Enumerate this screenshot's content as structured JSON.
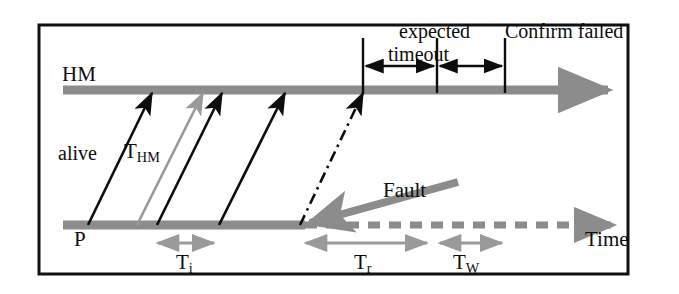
{
  "figure": {
    "kind": "timing-sequence-diagram",
    "colors": {
      "border": "#111111",
      "lifeline_gray": "#8c8c8c",
      "arrow_black": "#0d0d0d",
      "arrow_gray": "#9a9a9a",
      "fault_gray": "#8c8c8c",
      "background": "#ffffff"
    },
    "frame": {
      "x": 38,
      "y": 24,
      "width": 590,
      "height": 250
    }
  },
  "lifelines": {
    "hm": {
      "label": "HM",
      "y": 90,
      "x_start": 63,
      "x_end": 620
    },
    "p": {
      "label": "P",
      "y": 225,
      "x_start": 63,
      "x_solid_end": 303,
      "x_dashed_end": 625
    }
  },
  "labels": {
    "alive": "alive",
    "t_hm": "T",
    "t_hm_sub": "HM",
    "expected": "expected",
    "confirm_failed": "Confirm failed",
    "timeout": "timeout",
    "fault": "Fault",
    "time": "Time"
  },
  "intervals": [
    {
      "name": "T",
      "sub": "i",
      "x_start": 155,
      "x_end": 217,
      "y": 243,
      "label_x": 176
    },
    {
      "name": "T",
      "sub": "r",
      "x_start": 303,
      "x_end": 430,
      "y": 243,
      "label_x": 354
    },
    {
      "name": "T",
      "sub": "W",
      "x_start": 437,
      "x_end": 505,
      "y": 243,
      "label_x": 453
    }
  ],
  "markers": [
    {
      "name": "first-timeout-marker",
      "x": 363,
      "y_top": 38,
      "y_bottom": 92
    },
    {
      "name": "expected-marker",
      "x": 437,
      "y_top": 38,
      "y_bottom": 92
    },
    {
      "name": "confirm-failed-marker",
      "x": 505,
      "y_top": 38,
      "y_bottom": 92
    }
  ],
  "timeout_arrows": [
    {
      "name": "timeout-span-left",
      "x_start": 363,
      "x_end": 437,
      "y": 66
    },
    {
      "name": "timeout-span-right",
      "x_start": 437,
      "x_end": 505,
      "y": 66
    }
  ],
  "heartbeats": [
    {
      "name": "heartbeat-1",
      "style": "solid-black",
      "x_from": 88,
      "y_from": 225,
      "x_to": 152,
      "y_to": 93
    },
    {
      "name": "heartbeat-2",
      "style": "solid-gray",
      "x_from": 137,
      "y_from": 225,
      "x_to": 203,
      "y_to": 93
    },
    {
      "name": "heartbeat-3",
      "style": "solid-black",
      "x_from": 157,
      "y_from": 225,
      "x_to": 222,
      "y_to": 93
    },
    {
      "name": "heartbeat-4",
      "style": "solid-black",
      "x_from": 219,
      "y_from": 225,
      "x_to": 285,
      "y_to": 93
    },
    {
      "name": "heartbeat-5",
      "style": "dash-dot-black",
      "x_from": 300,
      "y_from": 225,
      "x_to": 363,
      "y_to": 93
    }
  ],
  "fault_arrow": {
    "x_from": 458,
    "y_from": 182,
    "x_to": 307,
    "y_to": 224
  }
}
